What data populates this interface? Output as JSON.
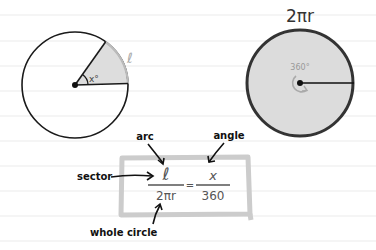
{
  "paper": {
    "background": "#ffffff",
    "rule_color": "#eeeeee",
    "rule_lines_y": [
      15,
      41,
      66,
      91,
      116,
      141,
      166,
      191,
      216,
      241
    ]
  },
  "sector_circle": {
    "angle_label": "x°",
    "arc_label": "ℓ",
    "fill": "#dddddd",
    "arc_color": "#bbbbbb",
    "stroke": "#1a1a1a"
  },
  "whole_circle": {
    "title": "2πr",
    "angle_label": "360°",
    "fill": "#dcdcdc",
    "stroke": "#333333"
  },
  "formula": {
    "numerator_left": "ℓ",
    "denominator_left": "2πr",
    "equals": "=",
    "numerator_right": "x",
    "denominator_right": "360",
    "box_color": "#cccccc"
  },
  "annotations": {
    "arc": "arc",
    "angle": "angle",
    "sector": "sector",
    "whole_circle": "whole circle"
  }
}
